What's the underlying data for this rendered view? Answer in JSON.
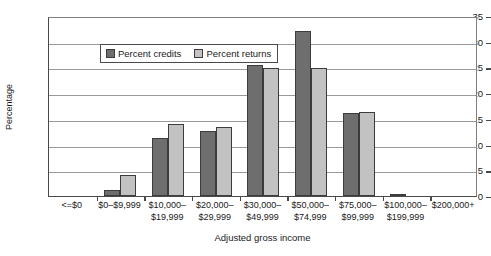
{
  "chart_data": {
    "type": "bar",
    "title": "",
    "xlabel": "Adjusted gross income",
    "ylabel": "Percentage",
    "ylim": [
      0,
      35
    ],
    "ytick_step": 5,
    "yticks": [
      0,
      5,
      10,
      15,
      20,
      25,
      30,
      35
    ],
    "grid": true,
    "legend_position": "top-left-inside",
    "categories": [
      "<=$0",
      "$0–$9,999",
      "$10,000–\n$19,999",
      "$20,000–\n$29,999",
      "$30,000–\n$49,999",
      "$50,000–\n$74,999",
      "$75,000–\n$99,999",
      "$100,000–\n$199,999",
      "$200,000+"
    ],
    "series": [
      {
        "name": "Percent credits",
        "color": "#6e6e6e",
        "values": [
          0,
          1.1,
          11.2,
          12.6,
          25.4,
          32.0,
          16.1,
          0.3,
          0
        ]
      },
      {
        "name": "Percent returns",
        "color": "#c2c2c2",
        "values": [
          0,
          4.0,
          14.0,
          13.4,
          24.8,
          24.9,
          16.4,
          0,
          0
        ]
      }
    ]
  },
  "legend": {
    "items": [
      {
        "label": "Percent credits",
        "swatch": "credits"
      },
      {
        "label": "Percent returns",
        "swatch": "returns"
      }
    ]
  },
  "axes": {
    "y_title": "Percentage",
    "x_title": "Adjusted gross income"
  }
}
